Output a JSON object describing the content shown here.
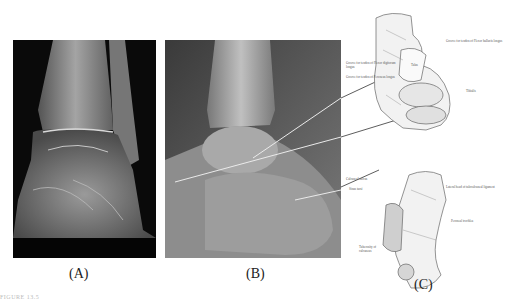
{
  "panels": [
    {
      "id": "A",
      "caption": "(A)",
      "type": "xray",
      "view": "anteroposterior ankle"
    },
    {
      "id": "B",
      "caption": "(B)",
      "type": "xray",
      "view": "lateral ankle"
    },
    {
      "id": "C",
      "caption": "(C)",
      "type": "anatomical-drawing",
      "view": "talus and calcaneus"
    }
  ],
  "drawing_labels": {
    "top_right": "Groove for tendon of Flexor hallucis longus",
    "left_1": "Groove for tendon of Flexor digitorum longus",
    "left_2": "Groove for tendon of Peroneus longus",
    "center": "Talus",
    "right": "Tibialis",
    "lower_1": "Calcaneal sulcus",
    "lower_2": "Sinus tarsi",
    "lower_right_1": "Lateral head of talocalcaneal ligament",
    "lower_right_2": "Peroneal trochlea",
    "bottom_left": "Tuberosity of calcaneus"
  },
  "figure_label": "FIGURE 13.5"
}
